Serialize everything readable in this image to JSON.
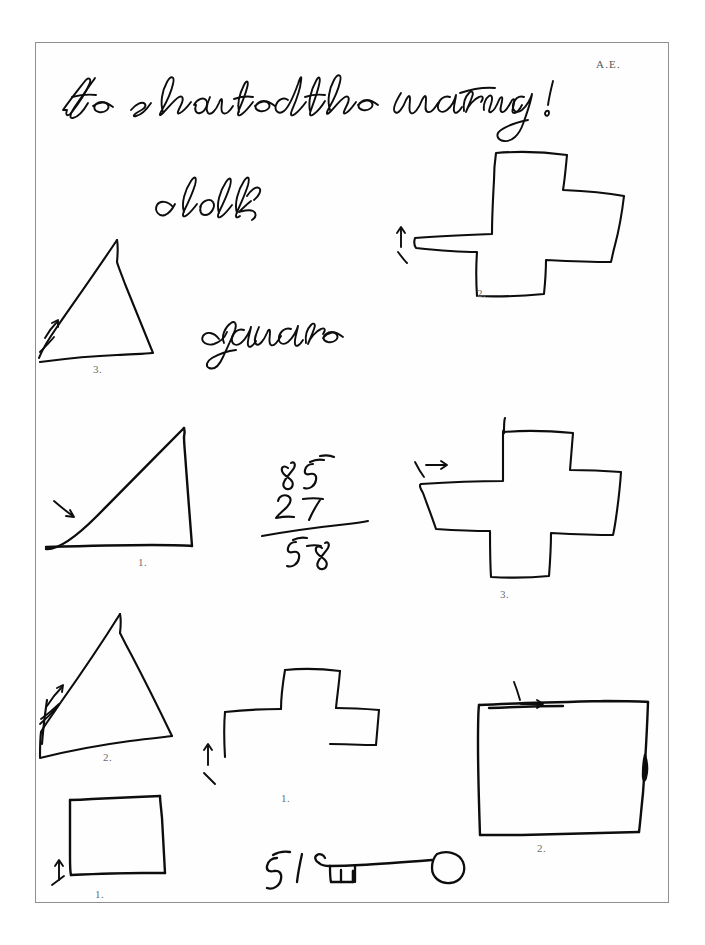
{
  "document": {
    "kind": "handwriting-and-figure-copy-assessment-sheet",
    "initials": "A.E.",
    "background_color": "#ffffff",
    "ink_color": "#000000",
    "border_color": "#8f8f8f",
    "printed_label_color": "#6d6d6d"
  },
  "handwriting": {
    "sentence": "He shouted the warning!",
    "word_clock": "clock",
    "word_square": "square"
  },
  "arithmetic": {
    "minuend": "85",
    "subtrahend": "27",
    "difference": "58",
    "loose_number": "51"
  },
  "figures": [
    {
      "id": "cross-top-right",
      "shape": "cross",
      "label": "2.",
      "arrow": "up"
    },
    {
      "id": "triangle-upper-left",
      "shape": "triangle",
      "label": "3.",
      "arrow": "up-right"
    },
    {
      "id": "triangle-middle-left",
      "shape": "triangle",
      "label": "1.",
      "arrow": "down-right"
    },
    {
      "id": "cross-middle-right",
      "shape": "cross",
      "label": "3.",
      "arrow": "right"
    },
    {
      "id": "triangle-lower-left",
      "shape": "triangle",
      "label": "2.",
      "arrow": "up-right"
    },
    {
      "id": "cross-lower-middle",
      "shape": "cross-incomplete",
      "label": "1.",
      "arrow": "up"
    },
    {
      "id": "square-lower-right",
      "shape": "square",
      "label": "2.",
      "arrow": "right"
    },
    {
      "id": "square-bottom-left",
      "shape": "square",
      "label": "1.",
      "arrow": "up"
    },
    {
      "id": "key-drawing",
      "shape": "key",
      "label": "",
      "arrow": "none"
    }
  ],
  "printed_labels": [
    {
      "text": "2.",
      "x": 477,
      "y": 287
    },
    {
      "text": "3.",
      "x": 93,
      "y": 363
    },
    {
      "text": "1.",
      "x": 138,
      "y": 556
    },
    {
      "text": "3.",
      "x": 500,
      "y": 588
    },
    {
      "text": "2.",
      "x": 103,
      "y": 751
    },
    {
      "text": "1.",
      "x": 281,
      "y": 792
    },
    {
      "text": "2.",
      "x": 537,
      "y": 842
    },
    {
      "text": "1.",
      "x": 95,
      "y": 888
    }
  ]
}
